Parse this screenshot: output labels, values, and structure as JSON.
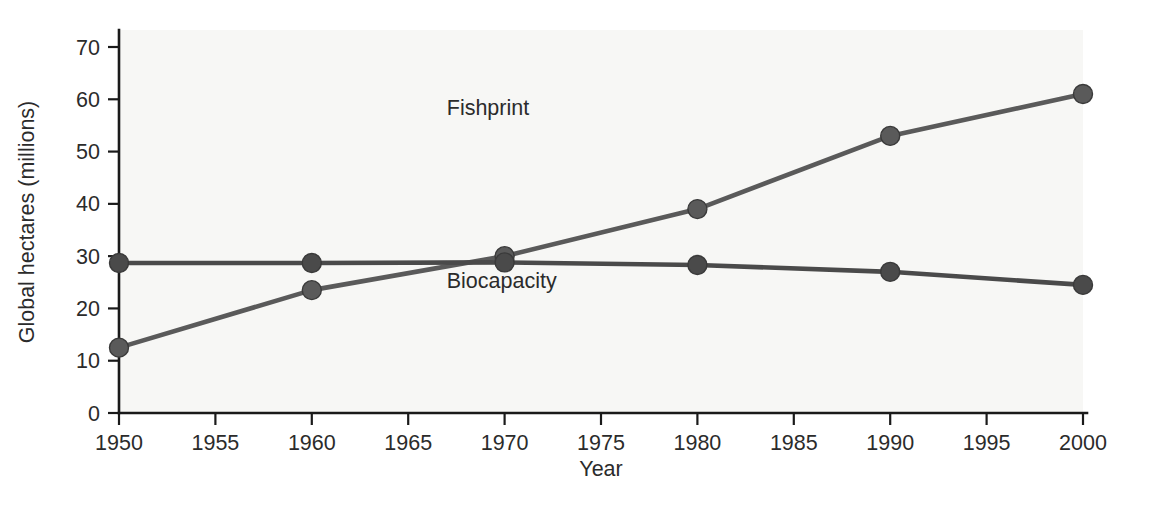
{
  "chart_data": {
    "type": "line",
    "title": "",
    "xlabel": "Year",
    "ylabel": "Global hectares (millions)",
    "x": [
      1950,
      1960,
      1970,
      1980,
      1990,
      2000
    ],
    "xlim": [
      1950,
      2000
    ],
    "ylim": [
      0,
      70
    ],
    "xticks": [
      1950,
      1955,
      1960,
      1965,
      1970,
      1975,
      1980,
      1985,
      1990,
      1995,
      2000
    ],
    "xticklabels": [
      "1950",
      "1955",
      "1960",
      "1965",
      "1970",
      "1975",
      "1980",
      "1985",
      "1990",
      "1995",
      "2000"
    ],
    "yticks": [
      0,
      10,
      20,
      30,
      40,
      50,
      60,
      70
    ],
    "yticklabels": [
      "0",
      "10",
      "20",
      "30",
      "40",
      "50",
      "60",
      "70"
    ],
    "grid": false,
    "legend": "inline-labels",
    "series": [
      {
        "name": "Fishprint",
        "values": [
          12.5,
          23.5,
          30.0,
          39.0,
          53.0,
          61.0
        ],
        "color": "#5a5a5a",
        "marker": "circle",
        "label_x": 1967,
        "label_y": 57
      },
      {
        "name": "Biocapacity",
        "values": [
          28.7,
          28.7,
          28.8,
          28.3,
          27.0,
          24.5
        ],
        "color": "#4a4a4a",
        "marker": "circle",
        "label_x": 1967,
        "label_y": 24
      }
    ]
  },
  "axis": {
    "x_title": "Year",
    "y_title": "Global hectares (millions)",
    "axis_color": "#1a1a1a"
  },
  "plot": {
    "background": "#f7f7f5",
    "page_background": "#ffffff"
  }
}
